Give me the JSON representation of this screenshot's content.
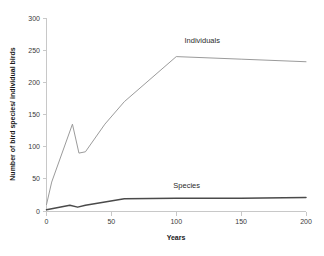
{
  "chart_data": {
    "type": "line",
    "title": "",
    "xlabel": "Years",
    "ylabel": "Number of bird species/ individual birds",
    "xlim": [
      0,
      200
    ],
    "ylim": [
      0,
      300
    ],
    "xticks": [
      0,
      50,
      100,
      150,
      200
    ],
    "yticks": [
      0,
      50,
      100,
      150,
      200,
      250,
      300
    ],
    "xtick_labels": [
      "0",
      "50",
      "100",
      "150",
      "200"
    ],
    "ytick_labels": [
      "0",
      "50",
      "100",
      "150",
      "200",
      "250",
      "300"
    ],
    "grid": false,
    "legend_position": "inline-annotation",
    "series": [
      {
        "name": "Individuals",
        "color": "#9b9b9b",
        "label_x": 120,
        "label_y": 261,
        "x": [
          0,
          4,
          20,
          25,
          30,
          45,
          60,
          100,
          150,
          200
        ],
        "values": [
          10,
          45,
          135,
          90,
          92,
          135,
          170,
          240,
          236,
          232
        ]
      },
      {
        "name": "Species",
        "color": "#4a4a4a",
        "label_x": 108,
        "label_y": 36,
        "x": [
          0,
          5,
          18,
          24,
          30,
          45,
          60,
          100,
          150,
          200
        ],
        "values": [
          2,
          4,
          9,
          6,
          9,
          14,
          19,
          20,
          20,
          21
        ]
      }
    ]
  },
  "axis": {
    "x_title": "Years",
    "y_title": "Number of bird species/ individual birds"
  }
}
